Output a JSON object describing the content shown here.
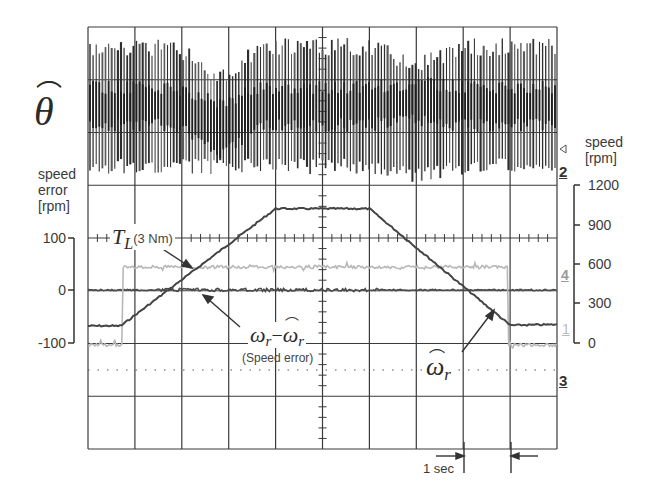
{
  "labels": {
    "theta_hat": "θ",
    "left_axis_title_1": "speed",
    "left_axis_title_2": "error",
    "left_axis_title_3": "[rpm]",
    "right_axis_title_1": "speed",
    "right_axis_title_2": "[rpm]",
    "left_ticks": [
      "100",
      "0",
      "-100"
    ],
    "right_ticks": [
      "1200",
      "900",
      "600",
      "300",
      "0"
    ],
    "load_torque_main": "T",
    "load_torque_sub": "L",
    "load_torque_note": "(3 Nm)",
    "speed_error_expr_a": "ω",
    "speed_error_expr_sub_a": "r",
    "speed_error_expr_minus": "−",
    "speed_error_expr_b": "ω",
    "speed_error_expr_sub_b": "r",
    "speed_error_note": "(Speed error)",
    "speed_est": "ω",
    "speed_est_sub": "r",
    "time_scale": "1 sec",
    "channel_markers": [
      "2",
      "4",
      "1",
      "3"
    ]
  },
  "colors": {
    "grid": "#3a3a3a",
    "trace_dark": "#3c3c3c",
    "trace_light": "#b4b4b4",
    "theta_trace": "#2e2e2e"
  },
  "chart_data": {
    "type": "line",
    "xlabel": "time (1 sec/div)",
    "x_unit": "s",
    "grid": true,
    "divisions": {
      "x": 10,
      "y": 8
    },
    "axes": {
      "left": {
        "label": "speed error [rpm]",
        "ticks": [
          100,
          0,
          -100
        ],
        "range": [
          -100,
          100
        ]
      },
      "right": {
        "label": "speed [rpm]",
        "ticks": [
          1200,
          900,
          600,
          300,
          0
        ],
        "range": [
          0,
          1200
        ]
      }
    },
    "series": [
      {
        "name": "θ̂ (estimated rotor position)",
        "panel": "top",
        "description": "high-frequency sawtooth-like position estimate, amplitude envelope dips around t≈2.5s and t≈7s",
        "x": [
          0,
          10
        ],
        "values": null
      },
      {
        "name": "ω̂r (estimated speed)",
        "axis": "right",
        "unit": "rpm",
        "x": [
          0.0,
          0.7,
          4.0,
          6.0,
          9.0,
          10.0
        ],
        "values": [
          130,
          130,
          1020,
          1020,
          135,
          140
        ]
      },
      {
        "name": "TL (3 Nm) load torque",
        "axis": "step",
        "x": [
          0.0,
          0.75,
          0.75,
          8.95,
          8.95,
          10.0
        ],
        "values": [
          0,
          0,
          3,
          3,
          0,
          0
        ],
        "unit": "Nm"
      },
      {
        "name": "ωr − ω̂r (speed error)",
        "axis": "left",
        "unit": "rpm",
        "x": [
          0,
          2,
          4,
          6,
          8,
          10
        ],
        "values": [
          0,
          0,
          0,
          0,
          0,
          0
        ]
      }
    ],
    "annotations": [
      "TL(3 Nm)",
      "ωr − ω̂r (Speed error)",
      "ω̂r",
      "1 sec",
      "θ̂"
    ],
    "channel_markers": [
      "2",
      "4",
      "1",
      "3"
    ]
  }
}
